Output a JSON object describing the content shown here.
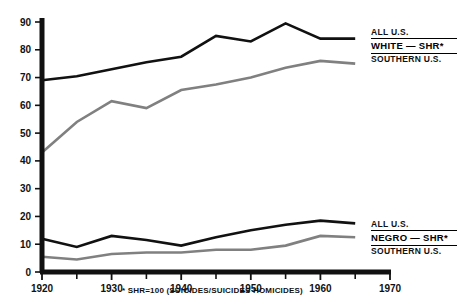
{
  "chart_data": {
    "type": "line",
    "title": "",
    "xlabel": "",
    "ylabel": "",
    "xlim": [
      1920,
      1970
    ],
    "ylim": [
      0,
      90
    ],
    "grid": false,
    "legend_position": "right",
    "x_ticks": [
      1920,
      1930,
      1940,
      1950,
      1960,
      1970
    ],
    "x_tick_labels": [
      "1920",
      "1930",
      "1940",
      "1950",
      "1960",
      "1970"
    ],
    "x_minor_ticks": [
      1925,
      1935,
      1945,
      1955,
      1965
    ],
    "y_ticks": [
      0,
      10,
      20,
      30,
      40,
      50,
      60,
      70,
      80,
      90
    ],
    "y_tick_labels": [
      "0",
      "10",
      "20",
      "30",
      "40",
      "50",
      "60",
      "70",
      "80",
      "90"
    ],
    "annotations": [
      "* SHR=100 (SUICIDES/SUICIDES HOMICIDES)"
    ],
    "series": [
      {
        "name": "WHITE - SHR* ALL U.S.",
        "group": "white",
        "region": "ALL U.S.",
        "color": "#111111",
        "x": [
          1920,
          1925,
          1930,
          1935,
          1940,
          1945,
          1950,
          1955,
          1960,
          1965
        ],
        "values": [
          69,
          70.5,
          73,
          75.5,
          77.5,
          85,
          83,
          89.5,
          84,
          84
        ]
      },
      {
        "name": "WHITE - SHR* SOUTHERN U.S.",
        "group": "white",
        "region": "SOUTHERN U.S.",
        "color": "#808080",
        "x": [
          1920,
          1925,
          1930,
          1935,
          1940,
          1945,
          1950,
          1955,
          1960,
          1965
        ],
        "values": [
          43,
          54,
          61.5,
          59,
          65.5,
          67.5,
          70,
          73.5,
          76,
          75
        ]
      },
      {
        "name": "NEGRO - SHR* ALL U.S.",
        "group": "negro",
        "region": "ALL U.S.",
        "color": "#111111",
        "x": [
          1920,
          1925,
          1930,
          1935,
          1940,
          1945,
          1950,
          1955,
          1960,
          1965
        ],
        "values": [
          12,
          9,
          13,
          11.5,
          9.5,
          12.5,
          15,
          17,
          18.5,
          17.5
        ]
      },
      {
        "name": "NEGRO - SHR* SOUTHERN U.S.",
        "group": "negro",
        "region": "SOUTHERN U.S.",
        "color": "#808080",
        "x": [
          1920,
          1925,
          1930,
          1935,
          1940,
          1945,
          1950,
          1955,
          1960,
          1965
        ],
        "values": [
          5.5,
          4.5,
          6.5,
          7,
          7,
          8,
          8,
          9.5,
          13,
          12.5
        ]
      }
    ]
  },
  "legends": {
    "white": {
      "top": "ALL U.S.",
      "middle": "WHITE — SHR*",
      "bottom": "SOUTHERN U.S."
    },
    "negro": {
      "top": "ALL U.S.",
      "middle": "NEGRO — SHR*",
      "bottom": "SOUTHERN U.S."
    }
  },
  "footnote": "* SHR=100 (SUICIDES/SUICIDES HOMICIDES)",
  "colors": {
    "all_us_line": "#111111",
    "southern_us_line": "#808080",
    "axis": "#111111",
    "background": "#ffffff"
  }
}
